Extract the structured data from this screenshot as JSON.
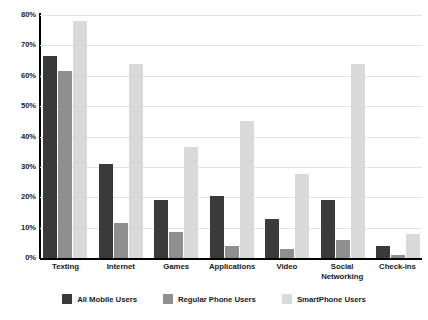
{
  "chart_data": {
    "type": "bar",
    "title": "",
    "subtitle": "",
    "xlabel": "",
    "ylabel": "",
    "ylim": [
      0,
      80
    ],
    "ytick_step": 10,
    "ytick_labels": [
      "80%",
      "70%",
      "60%",
      "50%",
      "40%",
      "30%",
      "20%",
      "10%",
      "0%"
    ],
    "grid": true,
    "legend_position": "bottom",
    "categories": [
      "Texting",
      "Internet",
      "Games",
      "Applications",
      "Video",
      "Social Networking",
      "Check-ins"
    ],
    "category_labels": [
      [
        "Texting"
      ],
      [
        "Internet"
      ],
      [
        "Games"
      ],
      [
        "Applications"
      ],
      [
        "Video"
      ],
      [
        "Social",
        "Networking"
      ],
      [
        "Check-ins"
      ]
    ],
    "series": [
      {
        "name": "All Mobile Users",
        "color": "#3a3a3a",
        "values": [
          66.5,
          31,
          19,
          20.5,
          13,
          19,
          4
        ]
      },
      {
        "name": "Regular Phone Users",
        "color": "#8f8f8f",
        "values": [
          61.5,
          11.5,
          8.5,
          4,
          3,
          6,
          1
        ]
      },
      {
        "name": "SmartPhone Users",
        "color": "#d9d9d9",
        "values": [
          78,
          64,
          36.5,
          45,
          27.5,
          64,
          8
        ]
      }
    ]
  },
  "colors": {
    "series_dark": "#3a3a3a",
    "series_medium": "#8f8f8f",
    "series_light": "#d9d9d9",
    "gridline": "#e3e3e3",
    "axis": "#000000",
    "text": "#1a1a1a",
    "background": "#ffffff"
  }
}
